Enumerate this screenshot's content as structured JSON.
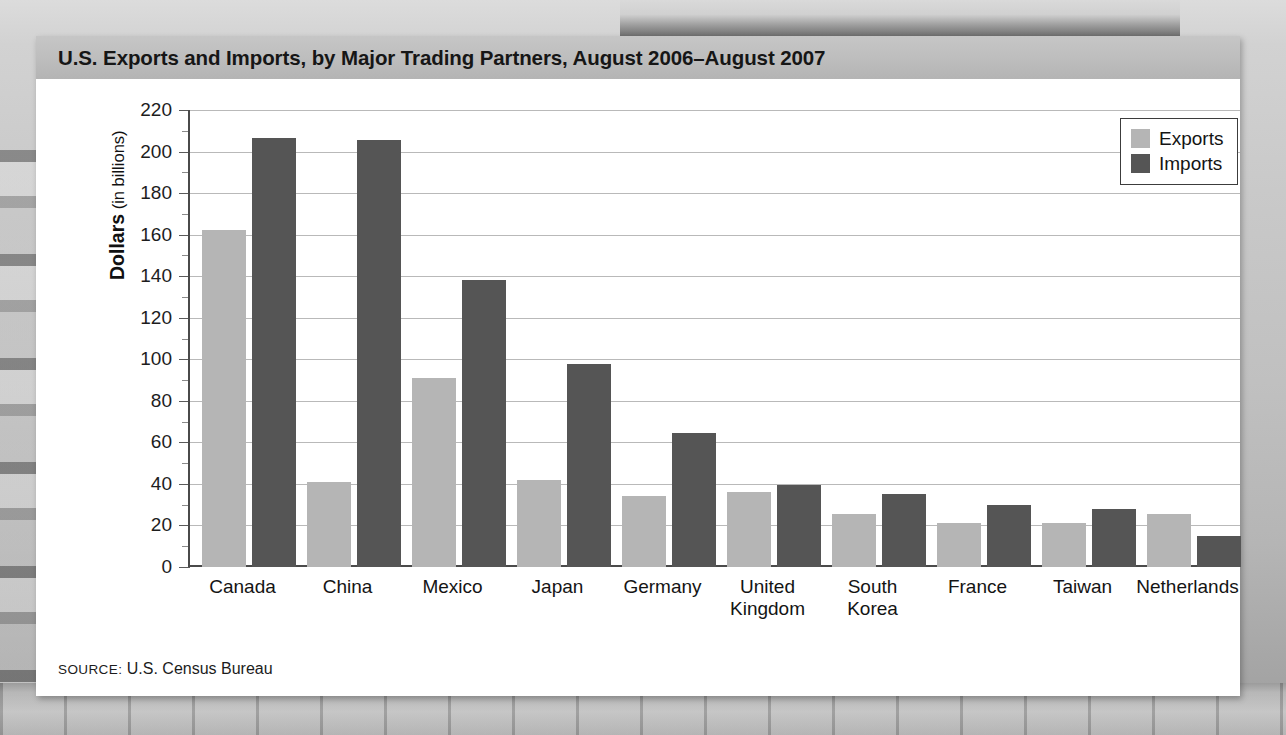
{
  "figure": {
    "title": "U.S. Exports and Imports, by Major Trading Partners, August 2006–August 2007",
    "source_label": "SOURCE:",
    "source_text": " U.S. Census Bureau"
  },
  "axis": {
    "y_title_bold": "Dollars",
    "y_title_plain": " (in billions)",
    "y_ticks": [
      "220",
      "200",
      "180",
      "160",
      "140",
      "120",
      "100",
      "80",
      "60",
      "40",
      "20",
      "0"
    ]
  },
  "legend": {
    "position": "top-right",
    "entries": [
      {
        "label": "Exports",
        "color": "#b5b5b5"
      },
      {
        "label": "Imports",
        "color": "#555555"
      }
    ]
  },
  "chart_data": {
    "type": "bar",
    "title": "U.S. Exports and Imports, by Major Trading Partners, August 2006–August 2007",
    "xlabel": "",
    "ylabel": "Dollars (in billions)",
    "ylim": [
      0,
      220
    ],
    "ytick_interval": 20,
    "yminor_tick_interval": 10,
    "grid": true,
    "legend_position": "top-right",
    "categories": [
      "Canada",
      "China",
      "Mexico",
      "Japan",
      "Germany",
      "United Kingdom",
      "South Korea",
      "France",
      "Taiwan",
      "Netherlands"
    ],
    "category_lines": [
      [
        "Canada"
      ],
      [
        "China"
      ],
      [
        "Mexico"
      ],
      [
        "Japan"
      ],
      [
        "Germany"
      ],
      [
        "United",
        "Kingdom"
      ],
      [
        "South",
        "Korea"
      ],
      [
        "France"
      ],
      [
        "Taiwan"
      ],
      [
        "Netherlands"
      ]
    ],
    "series": [
      {
        "name": "Exports",
        "color": "#b5b5b5",
        "values": [
          162,
          41,
          91,
          42,
          34,
          36,
          25.5,
          21,
          21,
          25.5
        ]
      },
      {
        "name": "Imports",
        "color": "#555555",
        "values": [
          206.5,
          205.5,
          138,
          97.5,
          64.5,
          39.5,
          35,
          30,
          28,
          15
        ]
      }
    ],
    "source": "SOURCE: U.S. Census Bureau"
  }
}
